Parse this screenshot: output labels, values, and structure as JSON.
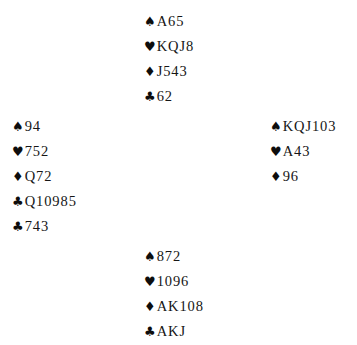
{
  "diagram": {
    "type": "bridge-deal",
    "background_color": "#ffffff",
    "text_color": "#141414",
    "suit_symbols": {
      "spade": "♠",
      "heart": "♥",
      "diamond": "♦",
      "club": "♣"
    },
    "hands": {
      "north": {
        "position": "north",
        "rows": [
          {
            "suit": "spade",
            "symbol": "♠",
            "ranks": "A65"
          },
          {
            "suit": "heart",
            "symbol": "♥",
            "ranks": "KQJ8"
          },
          {
            "suit": "diamond",
            "symbol": "♦",
            "ranks": "J543"
          },
          {
            "suit": "club",
            "symbol": "♣",
            "ranks": "62"
          }
        ]
      },
      "west": {
        "position": "west",
        "rows": [
          {
            "suit": "spade",
            "symbol": "♠",
            "ranks": "94"
          },
          {
            "suit": "heart",
            "symbol": "♥",
            "ranks": "752"
          },
          {
            "suit": "diamond",
            "symbol": "♦",
            "ranks": "Q72"
          },
          {
            "suit": "club",
            "symbol": "♣",
            "ranks": "Q10985"
          },
          {
            "suit": "club",
            "symbol": "♣",
            "ranks": "743"
          }
        ]
      },
      "east": {
        "position": "east",
        "rows": [
          {
            "suit": "spade",
            "symbol": "♠",
            "ranks": "KQJ103"
          },
          {
            "suit": "heart",
            "symbol": "♥",
            "ranks": "A43"
          },
          {
            "suit": "diamond",
            "symbol": "♦",
            "ranks": "96"
          }
        ]
      },
      "south": {
        "position": "south",
        "rows": [
          {
            "suit": "spade",
            "symbol": "♠",
            "ranks": "872"
          },
          {
            "suit": "heart",
            "symbol": "♥",
            "ranks": "1096"
          },
          {
            "suit": "diamond",
            "symbol": "♦",
            "ranks": "AK108"
          },
          {
            "suit": "club",
            "symbol": "♣",
            "ranks": "AKJ"
          }
        ]
      }
    }
  }
}
